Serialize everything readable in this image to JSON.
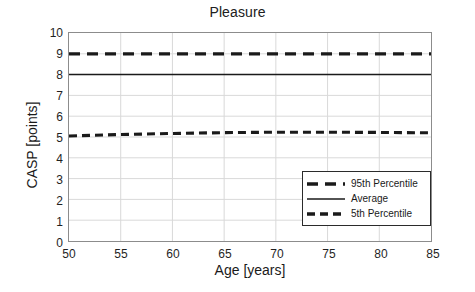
{
  "chart_data": {
    "type": "line",
    "title": "Pleasure",
    "xlabel": "Age [years]",
    "ylabel": "CASP [points]",
    "xlim": [
      50,
      85
    ],
    "ylim": [
      0,
      10
    ],
    "xticks": [
      50,
      55,
      60,
      65,
      70,
      75,
      80,
      85
    ],
    "yticks": [
      0,
      1,
      2,
      3,
      4,
      5,
      6,
      7,
      8,
      9,
      10
    ],
    "grid": true,
    "legend_position": "lower-right-inside",
    "x": [
      50,
      55,
      60,
      65,
      70,
      75,
      80,
      85
    ],
    "series": [
      {
        "name": "95th Percentile",
        "style": "dashed-thick",
        "color": "#1a1a1a",
        "values": [
          9.0,
          9.0,
          9.0,
          9.0,
          9.0,
          9.0,
          9.0,
          9.0
        ]
      },
      {
        "name": "Average",
        "style": "solid",
        "color": "#1a1a1a",
        "values": [
          8.0,
          8.0,
          8.0,
          8.0,
          8.0,
          8.0,
          8.0,
          8.0
        ]
      },
      {
        "name": "5th Percentile",
        "style": "dashed",
        "color": "#1a1a1a",
        "values": [
          5.05,
          5.12,
          5.17,
          5.21,
          5.23,
          5.23,
          5.22,
          5.2
        ]
      }
    ]
  },
  "legend": {
    "items": [
      {
        "label": "95th Percentile"
      },
      {
        "label": "Average"
      },
      {
        "label": "5th Percentile"
      }
    ]
  }
}
